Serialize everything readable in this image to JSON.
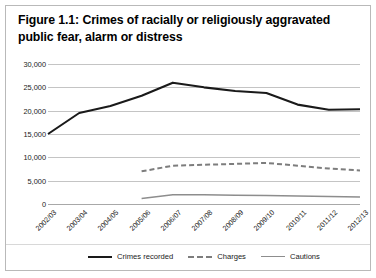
{
  "figure": {
    "title": "Figure 1.1: Crimes of racially or religiously aggravated public fear, alarm or distress"
  },
  "chart_data": {
    "type": "line",
    "title": "Figure 1.1: Crimes of racially or religiously aggravated public fear, alarm or distress",
    "xlabel": "",
    "ylabel": "",
    "ylim": [
      0,
      30000
    ],
    "ytick_labels": [
      "0",
      "5,000",
      "10,000",
      "15,000",
      "20,000",
      "25,000",
      "30,000"
    ],
    "ytick_values": [
      0,
      5000,
      10000,
      15000,
      20000,
      25000,
      30000
    ],
    "grid": true,
    "legend_position": "bottom",
    "categories": [
      "2002/03",
      "2003/04",
      "2004/05",
      "2005/06",
      "2006/07",
      "2007/08",
      "2008/09",
      "2009/10",
      "2010/11",
      "2011/12",
      "2012/13"
    ],
    "series": [
      {
        "name": "Crimes recorded",
        "style": "solid",
        "color": "#1a1a1a",
        "values": [
          15000,
          19500,
          21000,
          23200,
          26000,
          25000,
          24200,
          23800,
          21300,
          20200,
          20300
        ]
      },
      {
        "name": "Charges",
        "style": "dashed",
        "color": "#7d7d7d",
        "values": [
          null,
          null,
          null,
          7000,
          8200,
          8400,
          8600,
          8800,
          8200,
          7600,
          7200
        ]
      },
      {
        "name": "Cautions",
        "style": "solid",
        "color": "#8d8d8d",
        "values": [
          null,
          null,
          null,
          1200,
          2000,
          2000,
          1900,
          1800,
          1700,
          1600,
          1500
        ]
      }
    ]
  },
  "legend": {
    "items": [
      {
        "label": "Crimes recorded"
      },
      {
        "label": "Charges"
      },
      {
        "label": "Cautions"
      }
    ]
  }
}
